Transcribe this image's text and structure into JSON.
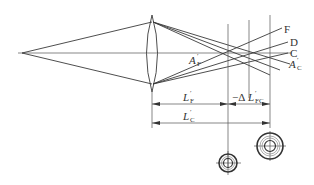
{
  "diagram": {
    "ray_labels": {
      "F": "F",
      "D": "D",
      "C": "C"
    },
    "point_labels": {
      "AF_main": "A",
      "AF_prime": "′",
      "AF_sub": "F",
      "AC_main": "A",
      "AC_prime": "′",
      "AC_sub": "C"
    },
    "dimensions": {
      "LF_main": "L",
      "LF_prime": "′",
      "LF_sub": "F",
      "LC_main": "L",
      "LC_prime": "′",
      "LC_sub": "C",
      "dLFC_prefix": "−Δ",
      "dLFC_main": "L",
      "dLFC_prime": "′",
      "dLFC_sub": "FC"
    },
    "colors": {
      "line": "#3a3a3a",
      "background": "#ffffff"
    }
  }
}
